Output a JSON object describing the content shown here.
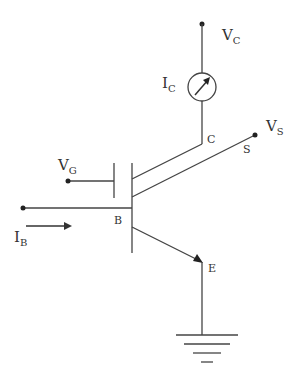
{
  "diagram": {
    "type": "transistor-circuit",
    "colors": {
      "wire": "#444444",
      "text": "#333333",
      "background": "#ffffff"
    },
    "labels": {
      "vc": {
        "main": "V",
        "sub": "C"
      },
      "ic": {
        "main": "I",
        "sub": "C"
      },
      "vs": {
        "main": "V",
        "sub": "S"
      },
      "vg": {
        "main": "V",
        "sub": "G"
      },
      "ib": {
        "main": "I",
        "sub": "B"
      },
      "terminal_c": "C",
      "terminal_s": "S",
      "terminal_b": "B",
      "terminal_e": "E"
    },
    "components": [
      {
        "name": "collector-supply-terminal",
        "label": "VC"
      },
      {
        "name": "ammeter",
        "label": "IC"
      },
      {
        "name": "transistor",
        "terminals": [
          "C",
          "S",
          "B",
          "E"
        ]
      },
      {
        "name": "gate-capacitor-plate",
        "label": "VG"
      },
      {
        "name": "base-input",
        "label": "IB"
      },
      {
        "name": "ground",
        "terminal": "E"
      }
    ]
  }
}
